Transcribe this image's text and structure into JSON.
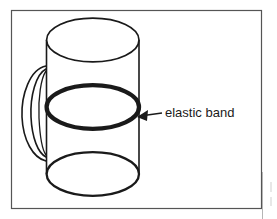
{
  "figure": {
    "background_color": "#ffffff",
    "stroke_color": "#1a1a1a",
    "border_color": "#4d4d4d",
    "annotations": [
      {
        "id": "elastic-band",
        "label": "elastic band",
        "label_x": 165,
        "label_y": 114,
        "font_size": 13,
        "points_to": "middle-ellipse"
      }
    ],
    "shapes": {
      "frame": {
        "x": 11,
        "y": 10,
        "width": 251,
        "height": 199
      },
      "cylinder": {
        "left_x": 46,
        "right_x": 139,
        "top_y": 40,
        "bottom_y": 174,
        "ellipse_rx": 46.5,
        "ellipse_ry": 22
      },
      "top_ellipse": {
        "cx": 93,
        "cy": 40,
        "rx": 46,
        "ry": 22,
        "stroke_width": 1.6
      },
      "middle_ellipse": {
        "cx": 93,
        "cy": 107,
        "rx": 46,
        "ry": 22,
        "stroke_width": 4.2
      },
      "bottom_ellipse": {
        "cx": 93,
        "cy": 174,
        "rx": 46,
        "ry": 22,
        "stroke_width": 2.2
      },
      "handle": {
        "top_y": 67,
        "bottom_y": 160,
        "leftmost_x": 23
      }
    }
  },
  "page_edge": {
    "visible": true,
    "x": 262
  }
}
